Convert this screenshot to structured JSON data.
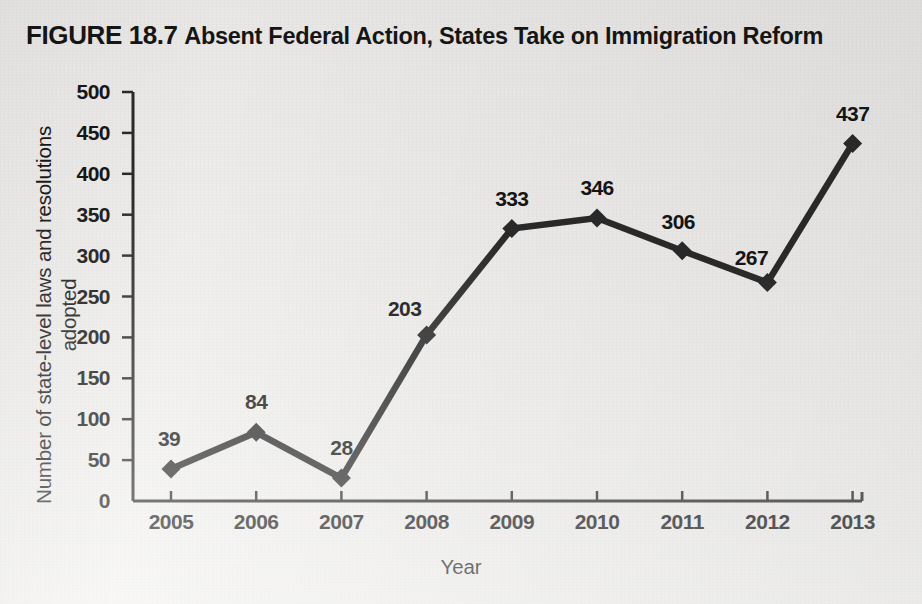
{
  "title": {
    "figure_number": "FIGURE 18.7",
    "caption": "Absent Federal Action, States Take on Immigration Reform"
  },
  "colors": {
    "background": "#f2f1ef",
    "line": "#2b2b2b",
    "axis": "#2b2b2b",
    "text": "#161616"
  },
  "chart_data": {
    "type": "line",
    "title": "FIGURE 18.7 Absent Federal Action, States Take on Immigration Reform",
    "xlabel": "Year",
    "ylabel": "Number of state-level laws and resolutions adopted",
    "categories": [
      "2005",
      "2006",
      "2007",
      "2008",
      "2009",
      "2010",
      "2011",
      "2012",
      "2013"
    ],
    "values": [
      39,
      84,
      28,
      203,
      333,
      346,
      306,
      267,
      437
    ],
    "point_labels": [
      "39",
      "84",
      "28",
      "203",
      "333",
      "346",
      "306",
      "267",
      "437"
    ],
    "ylim": [
      0,
      500
    ],
    "ytick_labels": [
      "0",
      "50",
      "100",
      "150",
      "200",
      "250",
      "300",
      "350",
      "400",
      "450",
      "500"
    ],
    "yticks": [
      0,
      50,
      100,
      150,
      200,
      250,
      300,
      350,
      400,
      450,
      500
    ],
    "grid": false,
    "legend": null,
    "marker": "diamond",
    "series": [
      {
        "name": "State-level immigration laws and resolutions adopted",
        "values": [
          39,
          84,
          28,
          203,
          333,
          346,
          306,
          267,
          437
        ]
      }
    ]
  }
}
